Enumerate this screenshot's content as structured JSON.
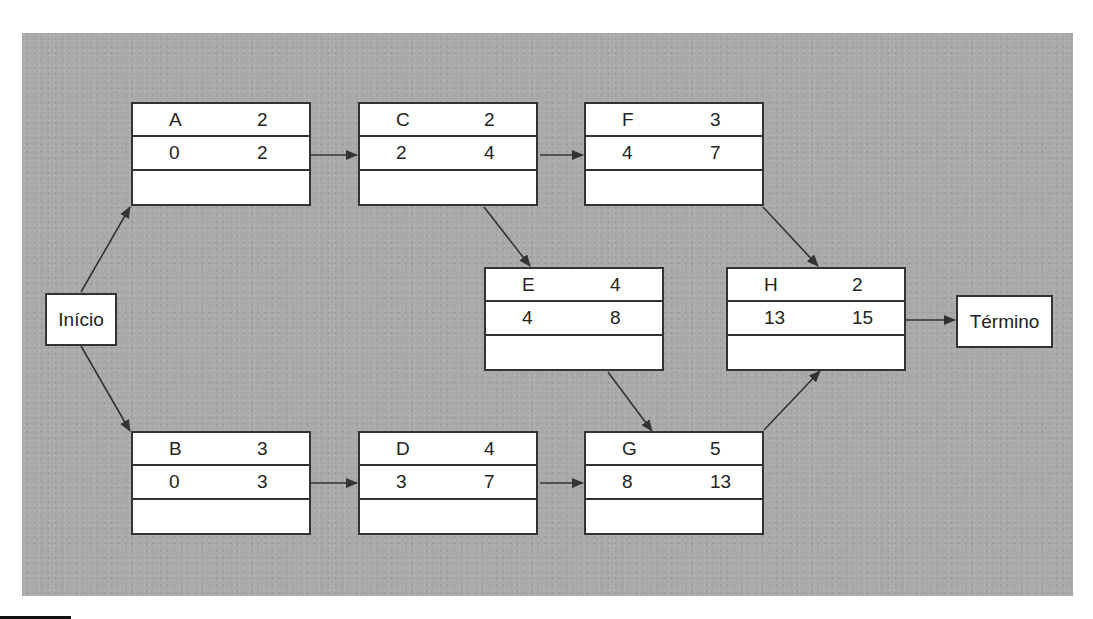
{
  "diagram": {
    "type": "activity-on-node network",
    "start": {
      "label": "Início"
    },
    "end": {
      "label": "Término"
    },
    "nodes": [
      {
        "id": "A",
        "duration": "2",
        "es": "0",
        "ef": "2"
      },
      {
        "id": "C",
        "duration": "2",
        "es": "2",
        "ef": "4"
      },
      {
        "id": "F",
        "duration": "3",
        "es": "4",
        "ef": "7"
      },
      {
        "id": "E",
        "duration": "4",
        "es": "4",
        "ef": "8"
      },
      {
        "id": "H",
        "duration": "2",
        "es": "13",
        "ef": "15"
      },
      {
        "id": "B",
        "duration": "3",
        "es": "0",
        "ef": "3"
      },
      {
        "id": "D",
        "duration": "4",
        "es": "3",
        "ef": "7"
      },
      {
        "id": "G",
        "duration": "5",
        "es": "8",
        "ef": "13"
      }
    ],
    "edges": [
      [
        "Início",
        "A"
      ],
      [
        "Início",
        "B"
      ],
      [
        "A",
        "C"
      ],
      [
        "C",
        "F"
      ],
      [
        "C",
        "E"
      ],
      [
        "F",
        "H"
      ],
      [
        "E",
        "G"
      ],
      [
        "B",
        "D"
      ],
      [
        "D",
        "G"
      ],
      [
        "G",
        "H"
      ],
      [
        "H",
        "Término"
      ]
    ],
    "colors": {
      "background": "#a9a9a9",
      "node_fill": "#ffffff",
      "stroke": "#333333"
    }
  }
}
